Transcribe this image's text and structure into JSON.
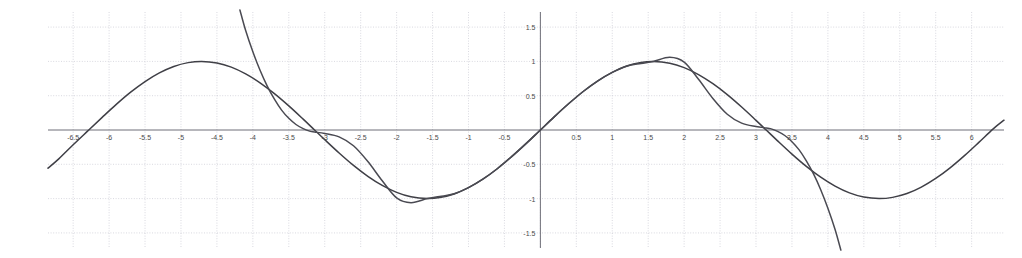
{
  "chart_data": {
    "type": "line",
    "title": "",
    "subtitle": "",
    "xlabel": "",
    "ylabel": "",
    "xlim": [
      -6.85,
      6.45
    ],
    "ylim": [
      -1.72,
      1.72
    ],
    "grid": true,
    "legend_position": "none",
    "x_ticks": [
      -6.5,
      -6,
      -5.5,
      -5,
      -4.5,
      -4,
      -3.5,
      -3,
      -2.5,
      -2,
      -1.5,
      -1,
      -0.5,
      0.5,
      1,
      1.5,
      2,
      2.5,
      3,
      3.5,
      4,
      4.5,
      5,
      5.5,
      6
    ],
    "x_tick_labels": [
      "-6.5",
      "-6",
      "-5.5",
      "-5",
      "-4.5",
      "-4",
      "-3.5",
      "-3",
      "-2.5",
      "-2",
      "-1.5",
      "-1",
      "-0.5",
      "0.5",
      "1",
      "1.5",
      "2",
      "2.5",
      "3",
      "3.5",
      "4",
      "4.5",
      "5",
      "5.5",
      "6"
    ],
    "y_ticks": [
      -1.5,
      -1,
      -0.5,
      0.5,
      1,
      1.5
    ],
    "y_tick_labels": [
      "-1.5",
      "-1",
      "-0.5",
      "0.5",
      "1",
      "1.5"
    ],
    "x_gridlines": [
      -6.5,
      -6,
      -5.5,
      -5,
      -4.5,
      -4,
      -3.5,
      -3,
      -2.5,
      -2,
      -1.5,
      -1,
      -0.5,
      0,
      0.5,
      1,
      1.5,
      2,
      2.5,
      3,
      3.5,
      4,
      4.5,
      5,
      5.5,
      6
    ],
    "y_gridlines": [
      -1.5,
      -1,
      -0.5,
      0.5,
      1,
      1.5
    ],
    "colors": {
      "sine_curve": "#3f3f46",
      "taylor_curve": "#4a4a52",
      "axis": "#6f6f78",
      "grid": "#c9c9d2",
      "background": "#ffffff",
      "tick_text": "#4a4a4a"
    },
    "series": [
      {
        "name": "sin(x)",
        "style": "solid",
        "color": "#3f3f46",
        "x": [
          -6.85,
          -6.7,
          -6.5,
          -6.3,
          -6.1,
          -5.9,
          -5.7,
          -5.5,
          -5.3,
          -5.1,
          -4.9,
          -4.712,
          -4.5,
          -4.3,
          -4.1,
          -3.9,
          -3.7,
          -3.5,
          -3.3,
          -3.1416,
          -3.0,
          -2.8,
          -2.6,
          -2.4,
          -2.2,
          -2.0,
          -1.8,
          -1.5708,
          -1.4,
          -1.2,
          -1.0,
          -0.8,
          -0.6,
          -0.4,
          -0.2,
          0.0,
          0.2,
          0.4,
          0.6,
          0.8,
          1.0,
          1.2,
          1.4,
          1.5708,
          1.8,
          2.0,
          2.2,
          2.4,
          2.6,
          2.8,
          3.0,
          3.1416,
          3.3,
          3.5,
          3.7,
          3.9,
          4.1,
          4.3,
          4.5,
          4.712,
          4.9,
          5.1,
          5.3,
          5.5,
          5.7,
          5.9,
          6.1,
          6.3,
          6.45
        ],
        "y": [
          -0.556,
          -0.421,
          -0.215,
          -0.017,
          0.18,
          0.373,
          0.551,
          0.706,
          0.832,
          0.926,
          0.982,
          1.0,
          0.978,
          0.917,
          0.818,
          0.688,
          0.53,
          0.351,
          0.158,
          0.0,
          -0.141,
          -0.335,
          -0.516,
          -0.675,
          -0.808,
          -0.909,
          -0.974,
          -1.0,
          -0.985,
          -0.932,
          -0.841,
          -0.717,
          -0.565,
          -0.389,
          -0.199,
          0.0,
          0.199,
          0.389,
          0.565,
          0.717,
          0.841,
          0.932,
          0.985,
          1.0,
          0.974,
          0.909,
          0.808,
          0.675,
          0.516,
          0.335,
          0.141,
          0.0,
          -0.158,
          -0.351,
          -0.53,
          -0.688,
          -0.818,
          -0.917,
          -0.978,
          -1.0,
          -0.982,
          -0.926,
          -0.832,
          -0.706,
          -0.551,
          -0.373,
          -0.18,
          0.017,
          0.143
        ]
      },
      {
        "name": "Taylor polynomial approximation of sin(x) at 0",
        "style": "solid",
        "color": "#4a4a52",
        "x": [
          -4.18,
          -4.1,
          -4.0,
          -3.9,
          -3.8,
          -3.7,
          -3.6,
          -3.5,
          -3.4,
          -3.3,
          -3.2,
          -3.1416,
          -3.0,
          -2.8,
          -2.6,
          -2.4,
          -2.2,
          -2.0,
          -1.8,
          -1.5708,
          -1.4,
          -1.2,
          -1.0,
          -0.8,
          -0.6,
          -0.4,
          -0.2,
          0.0,
          0.2,
          0.4,
          0.6,
          0.8,
          1.0,
          1.2,
          1.4,
          1.5708,
          1.8,
          2.0,
          2.2,
          2.4,
          2.6,
          2.8,
          3.0,
          3.1416,
          3.2,
          3.3,
          3.4,
          3.5,
          3.6,
          3.7,
          3.8,
          3.9,
          4.0,
          4.1,
          4.18
        ],
        "y": [
          1.75,
          1.45,
          1.14,
          0.87,
          0.64,
          0.45,
          0.29,
          0.17,
          0.08,
          0.02,
          -0.02,
          -0.03,
          -0.05,
          -0.1,
          -0.23,
          -0.46,
          -0.74,
          -0.99,
          -1.06,
          -1.0,
          -0.97,
          -0.93,
          -0.84,
          -0.717,
          -0.565,
          -0.389,
          -0.199,
          0.0,
          0.199,
          0.389,
          0.565,
          0.717,
          0.84,
          0.93,
          0.97,
          1.0,
          1.06,
          0.99,
          0.74,
          0.46,
          0.23,
          0.1,
          0.05,
          0.03,
          0.02,
          -0.02,
          -0.08,
          -0.17,
          -0.29,
          -0.45,
          -0.64,
          -0.87,
          -1.14,
          -1.45,
          -1.75
        ]
      }
    ]
  }
}
